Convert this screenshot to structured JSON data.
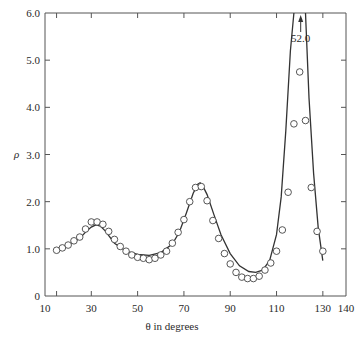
{
  "chart_data": {
    "type": "scatter",
    "title": "",
    "xlabel": "θ in degrees",
    "ylabel": "ρ",
    "xlim": [
      10,
      140
    ],
    "ylim": [
      0,
      6.0
    ],
    "grid": false,
    "legend": null,
    "x_ticks": [
      10,
      30,
      50,
      70,
      90,
      110,
      130,
      140
    ],
    "x_tick_labels": [
      "10",
      "30",
      "50",
      "70",
      "90",
      "110",
      "130",
      "140"
    ],
    "x_minor_ticks": [
      15,
      30,
      50,
      70,
      90,
      110,
      130
    ],
    "y_ticks": [
      0,
      1.0,
      2.0,
      3.0,
      4.0,
      5.0,
      6.0
    ],
    "y_tick_labels": [
      "0",
      "1.0",
      "2.0",
      "3.0",
      "4.0",
      "5.0",
      "6.0"
    ],
    "annotations": [
      {
        "text": "52.0",
        "x": 120,
        "y": 5.6,
        "arrow": "up",
        "note": "curve peak off scale"
      }
    ],
    "series": [
      {
        "name": "measured",
        "style": "open-circles",
        "x": [
          15,
          17.5,
          20,
          22.5,
          25,
          27.5,
          30,
          32.5,
          35,
          37.5,
          40,
          42.5,
          45,
          47.5,
          50,
          52.5,
          55,
          57.5,
          60,
          62.5,
          65,
          67.5,
          70,
          72.5,
          75,
          77.5,
          80,
          82.5,
          85,
          87.5,
          90,
          92.5,
          95,
          97.5,
          100,
          102.5,
          105,
          107.5,
          110,
          112.5,
          115,
          117.5,
          120,
          122.5,
          125,
          127.5,
          130
        ],
        "y": [
          0.97,
          1.02,
          1.08,
          1.17,
          1.25,
          1.42,
          1.57,
          1.57,
          1.52,
          1.37,
          1.2,
          1.05,
          0.95,
          0.87,
          0.82,
          0.8,
          0.77,
          0.8,
          0.87,
          0.95,
          1.12,
          1.35,
          1.62,
          2.0,
          2.3,
          2.32,
          2.02,
          1.6,
          1.22,
          0.9,
          0.68,
          0.5,
          0.4,
          0.37,
          0.37,
          0.42,
          0.55,
          0.7,
          0.95,
          1.4,
          2.2,
          3.65,
          4.75,
          3.72,
          2.3,
          1.37,
          0.95
        ]
      },
      {
        "name": "theory",
        "style": "solid-line",
        "x": [
          15,
          20,
          25,
          28,
          30,
          32,
          34,
          36,
          40,
          45,
          50,
          55,
          60,
          65,
          68,
          71,
          74,
          76,
          77,
          78,
          80,
          83,
          86,
          90,
          94,
          98,
          101,
          104,
          107,
          110,
          112,
          114,
          116,
          117.5,
          118.5,
          120,
          121.5,
          122.5,
          124,
          126,
          128,
          130
        ],
        "y": [
          0.98,
          1.08,
          1.22,
          1.38,
          1.46,
          1.51,
          1.48,
          1.38,
          1.12,
          0.95,
          0.88,
          0.86,
          0.92,
          1.1,
          1.35,
          1.75,
          2.18,
          2.37,
          2.4,
          2.35,
          2.15,
          1.72,
          1.3,
          0.9,
          0.64,
          0.52,
          0.5,
          0.55,
          0.75,
          1.3,
          2.1,
          3.5,
          5.2,
          6.0,
          6.0,
          52.0,
          6.0,
          6.0,
          4.2,
          2.6,
          1.45,
          0.75
        ]
      }
    ]
  }
}
